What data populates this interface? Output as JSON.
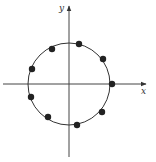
{
  "diagram": {
    "type": "unit-circle-points",
    "axes": {
      "x_label": "x",
      "y_label": "y"
    },
    "circle": {
      "cx": 69,
      "cy": 84,
      "r": 41
    },
    "points": [
      {
        "x": 79,
        "y": 44
      },
      {
        "x": 52,
        "y": 49
      },
      {
        "x": 103,
        "y": 59
      },
      {
        "x": 32,
        "y": 69
      },
      {
        "x": 112,
        "y": 84
      },
      {
        "x": 31,
        "y": 97
      },
      {
        "x": 102,
        "y": 112
      },
      {
        "x": 48,
        "y": 117
      },
      {
        "x": 77,
        "y": 125
      }
    ],
    "point_count": 9,
    "colors": {
      "stroke": "#333333",
      "point": "#222222"
    }
  }
}
